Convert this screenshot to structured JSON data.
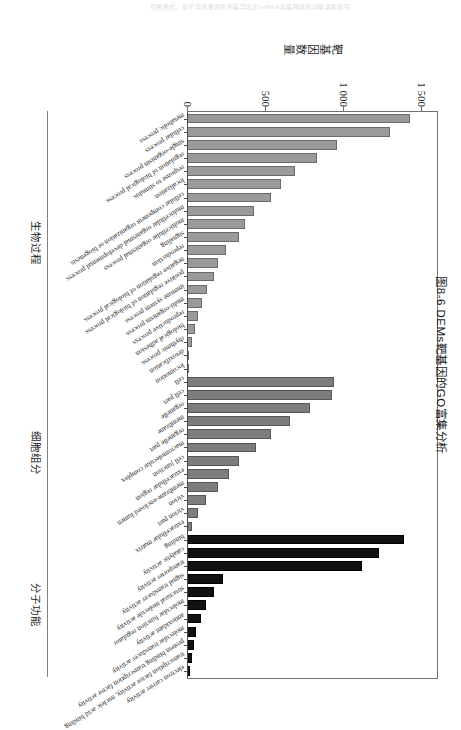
{
  "scan_header": "引用格式：基于高通量测序的差异表达miRNA及其靶基因功能富集研究",
  "caption": "图8-6  DEMs靶基因的GO富集分析",
  "chart_data": {
    "type": "bar",
    "title": "",
    "xlabel": "",
    "ylabel": "靶基因数量",
    "ylim": [
      0,
      1600
    ],
    "yticks": [
      0,
      500,
      1000,
      1500
    ],
    "ytick_labels": [
      "0",
      "500",
      "1 000",
      "1 500"
    ],
    "grid": false,
    "legend_position": "none",
    "orientation": "vertical-bars-rotated-page",
    "group_names": [
      "生物过程",
      "细胞组分",
      "分子功能"
    ],
    "group_names_en": [
      "Biological Process",
      "Cellular Component",
      "Molecular Function"
    ],
    "group_colors": [
      "#9a9a9a",
      "#7d7d7d",
      "#111111"
    ],
    "groups": [
      {
        "name": "生物过程",
        "key": "bp",
        "categories": [
          "metabolic process",
          "cellular process",
          "single-organism process",
          "regulation of biological process",
          "response to stimulus",
          "localization",
          "cellular component organization or biogenesis",
          "multicellular organismal developmental process",
          "multicellular organismal process",
          "signaling",
          "reproduction",
          "negative regulation of biological process",
          "positive regulation of biological process",
          "immune system process",
          "multi-organism process",
          "reproductive process",
          "biological adhesion",
          "rhythmic process",
          "detoxification",
          "locomotion"
        ],
        "values": [
          1430,
          1300,
          960,
          830,
          690,
          600,
          540,
          430,
          370,
          330,
          250,
          200,
          175,
          130,
          95,
          70,
          52,
          30,
          16,
          10
        ]
      },
      {
        "name": "细胞组分",
        "key": "cc",
        "categories": [
          "cell",
          "cell part",
          "organelle",
          "membrane",
          "organelle part",
          "macromolecular complex",
          "cell junction",
          "extracellular region",
          "membrane-enclosed lumen",
          "virion",
          "virion part",
          "extracellular matrix"
        ],
        "values": [
          940,
          930,
          790,
          660,
          540,
          440,
          330,
          270,
          200,
          120,
          70,
          35
        ]
      },
      {
        "name": "分子功能",
        "key": "mf",
        "categories": [
          "binding",
          "catalytic activity",
          "transporter activity",
          "signal transducer activity",
          "structural molecule activity",
          "molecular function regulator",
          "antioxidant activity",
          "molecular transducer activity",
          "protein binding transcription factor activity",
          "transcription factor activity, nucleic acid binding",
          "electron carrier activity"
        ],
        "values": [
          1390,
          1230,
          1120,
          230,
          175,
          120,
          90,
          55,
          42,
          30,
          18
        ]
      }
    ]
  }
}
